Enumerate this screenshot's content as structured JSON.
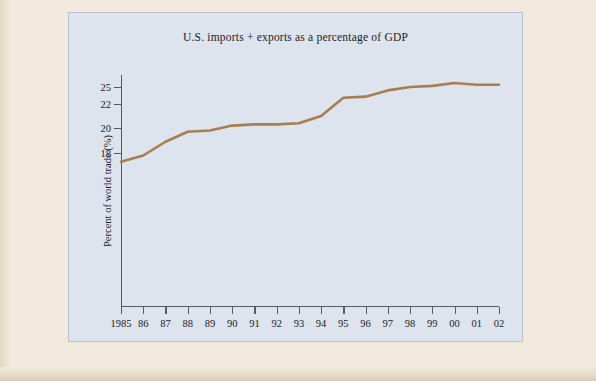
{
  "page": {
    "background_color": "#f1e9dd",
    "figure_background_color": "#dde4ed",
    "line_color": "#a87e50",
    "axis_color": "#555a66",
    "text_color": "#1b1b2b"
  },
  "chart_data": {
    "type": "line",
    "title": "U.S. imports + exports as a percentage of GDP",
    "xlabel": "",
    "ylabel": "Percent of world trade (%)",
    "grid": false,
    "legend": null,
    "categories": [
      "1985",
      "86",
      "87",
      "88",
      "89",
      "90",
      "91",
      "92",
      "93",
      "94",
      "95",
      "96",
      "97",
      "98",
      "99",
      "00",
      "01",
      "02"
    ],
    "x": [
      1985,
      1986,
      1987,
      1988,
      1989,
      1990,
      1991,
      1992,
      1993,
      1994,
      1995,
      1996,
      1997,
      1998,
      1999,
      2000,
      2001,
      2002
    ],
    "values": [
      17.3,
      17.8,
      18.9,
      19.7,
      19.8,
      20.2,
      20.3,
      20.3,
      20.4,
      21.0,
      23.1,
      23.3,
      24.4,
      25.0,
      25.2,
      25.7,
      25.4,
      25.4
    ],
    "ytick_labels": [
      "25",
      "22",
      "20",
      "18"
    ],
    "ytick_values": [
      25,
      22,
      20,
      18
    ],
    "ytick_pixel_y": [
      12,
      29,
      53,
      78
    ],
    "ylim": [
      17.0,
      25.9
    ],
    "xlim": [
      1985,
      2002
    ],
    "series": [
      {
        "name": "U.S. imports + exports as a percentage of GDP",
        "color": "#a87e50",
        "values": [
          17.3,
          17.8,
          18.9,
          19.7,
          19.8,
          20.2,
          20.3,
          20.3,
          20.4,
          21.0,
          23.1,
          23.3,
          24.4,
          25.0,
          25.2,
          25.7,
          25.4,
          25.4
        ]
      }
    ]
  }
}
